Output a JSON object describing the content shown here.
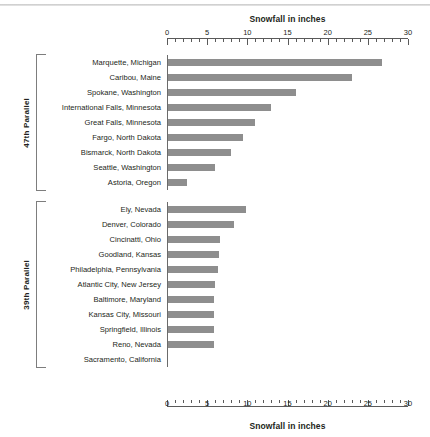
{
  "chart_data": {
    "type": "bar",
    "orientation": "horizontal",
    "title": "",
    "xlabel": "Snowfall in inches",
    "ylabel": "",
    "xlim": [
      0,
      30
    ],
    "xticks": [
      0,
      5,
      10,
      15,
      20,
      25,
      30
    ],
    "minor_tick_step": 1,
    "grid": false,
    "legend": "none",
    "bar_color": "#8e8e8e",
    "axis_title_top": "Snowfall in inches",
    "axis_title_bottom": "Snowfall in inches",
    "groups": [
      {
        "name": "47th Parallel",
        "categories": [
          "Marquette, Michigan",
          "Caribou, Maine",
          "Spokane, Washington",
          "International Falls, Minnesota",
          "Great Falls, Minnesota",
          "Fargo, North Dakota",
          "Bismarck, North Dakota",
          "Seattle, Washington",
          "Astoria, Oregon"
        ],
        "values": [
          26.8,
          23.0,
          16.0,
          13.0,
          11.0,
          9.5,
          8.0,
          6.0,
          2.5
        ]
      },
      {
        "name": "39th Parallel",
        "categories": [
          "Ely, Nevada",
          "Denver, Colorado",
          "Cincinatti, Ohio",
          "Goodland, Kansas",
          "Philadelphia, Pennsylvania",
          "Atlantic City, New Jersey",
          "Baltimore, Maryland",
          "Kansas City, Missouri",
          "Springfield, Illinois",
          "Reno, Nevada",
          "Sacramento, California"
        ],
        "values": [
          9.8,
          8.3,
          6.6,
          6.5,
          6.4,
          6.0,
          5.9,
          5.9,
          5.8,
          5.8,
          0.0
        ]
      }
    ]
  }
}
